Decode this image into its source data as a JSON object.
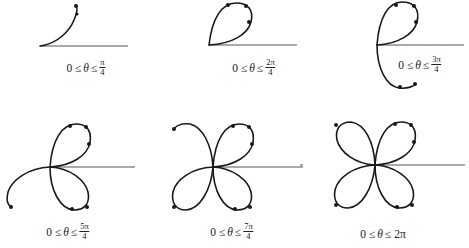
{
  "figure": {
    "stroke_color": "#1a1a1a",
    "panels": [
      {
        "id": "p1",
        "label_prefix": "0 ≤",
        "theta": "θ",
        "label_rel": "≤",
        "num": "π",
        "den": "4",
        "whole": ""
      },
      {
        "id": "p2",
        "label_prefix": "0 ≤",
        "theta": "θ",
        "label_rel": "≤",
        "num": "2π",
        "den": "4",
        "whole": ""
      },
      {
        "id": "p3",
        "label_prefix": "0 ≤",
        "theta": "θ",
        "label_rel": "≤",
        "num": "3π",
        "den": "4",
        "whole": ""
      },
      {
        "id": "p4",
        "label_prefix": "0 ≤",
        "theta": "θ",
        "label_rel": "≤",
        "num": "5π",
        "den": "4",
        "whole": ""
      },
      {
        "id": "p5",
        "label_prefix": "0 ≤",
        "theta": "θ",
        "label_rel": "≤",
        "num": "7π",
        "den": "4",
        "whole": ""
      },
      {
        "id": "p6",
        "label_prefix": "0 ≤",
        "theta": "θ",
        "label_rel": "≤",
        "num": "",
        "den": "",
        "whole": "2π"
      }
    ]
  }
}
